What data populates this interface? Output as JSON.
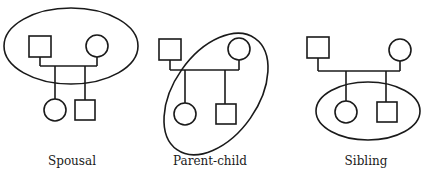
{
  "figure": {
    "panels": [
      {
        "id": "spousal",
        "label": "Spousal",
        "encircled": [
          "father",
          "mother"
        ]
      },
      {
        "id": "parent-child",
        "label": "Parent-child",
        "encircled": [
          "mother",
          "daughter",
          "son"
        ]
      },
      {
        "id": "sibling",
        "label": "Sibling",
        "encircled": [
          "daughter",
          "son"
        ]
      }
    ],
    "legend": {
      "square": "male",
      "circle": "female"
    },
    "colors": {
      "stroke": "#1a1a1a",
      "background": "#ffffff"
    }
  }
}
